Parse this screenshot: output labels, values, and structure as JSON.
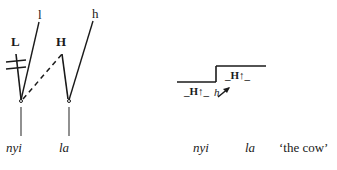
{
  "figure": {
    "type": "autosegmental-tone-diagram",
    "background_color": "#ffffff",
    "ink_color": "#1a1a1a"
  },
  "left_diagram": {
    "name": "association-diagram",
    "tone_letters": [
      {
        "label": "l",
        "x": 38,
        "y": 14
      },
      {
        "label": "h",
        "x": 92,
        "y": 13
      }
    ],
    "tone_tier": [
      {
        "label": "L",
        "x": 12,
        "y": 41
      },
      {
        "label": "H",
        "x": 57,
        "y": 41
      }
    ],
    "tbu_nodes": [
      {
        "name": "tbu-nyi",
        "x": 19,
        "y": 101
      },
      {
        "name": "tbu-la",
        "x": 67,
        "y": 101
      }
    ],
    "segments": [
      {
        "label": "nyi",
        "x": 7,
        "y": 148
      },
      {
        "label": "la",
        "x": 59,
        "y": 148
      }
    ],
    "delinking": {
      "name": "delinking-strikes",
      "description": "double strike-through on L association line"
    }
  },
  "right_diagram": {
    "name": "pitch-contour-diagram",
    "low_label": {
      "text": "H",
      "arrow": "↑",
      "x": 190,
      "y": 86
    },
    "high_label": {
      "text": "H",
      "arrow": "↑",
      "x": 231,
      "y": 70
    },
    "spreading_marker": {
      "text": "h",
      "x": 216,
      "y": 90
    },
    "segments": [
      {
        "label": "nyi",
        "x": 194,
        "y": 148
      },
      {
        "label": "la",
        "x": 242,
        "y": 148
      }
    ],
    "gloss": {
      "text": "‘the cow’",
      "x": 279,
      "y": 148
    }
  }
}
